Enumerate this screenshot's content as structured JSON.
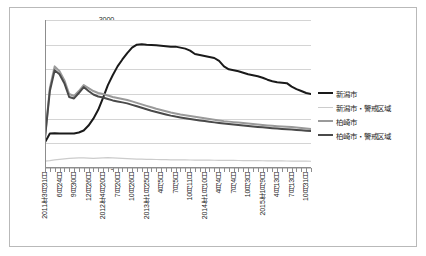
{
  "chart_data": {
    "type": "line",
    "title": "",
    "xlabel": "",
    "ylabel": "",
    "ylim": [
      0,
      3000
    ],
    "ytick_step": 500,
    "yticks": [
      "0",
      "500",
      "1000",
      "1500",
      "2000",
      "2500",
      "3000"
    ],
    "grid": true,
    "legend_position": "right",
    "x_tick_labels": [
      "2011年3月31日",
      "6月24日",
      "9月30日",
      "12月26日",
      "2012年4月20日",
      "7月20日",
      "10月26日",
      "2013年1月25日",
      "4月5日",
      "7月5日",
      "10月11日",
      "2014年1月10日",
      "4月4日",
      "7月4日",
      "10月3日",
      "2015年1月9日",
      "4月13日",
      "7月13日",
      "10月31日"
    ],
    "n_points": 56,
    "series": [
      {
        "name": "新潟市",
        "color": "#1a1a1a",
        "width": 2.0,
        "values": [
          520,
          700,
          705,
          700,
          700,
          700,
          700,
          720,
          760,
          860,
          1000,
          1180,
          1420,
          1680,
          1880,
          2060,
          2200,
          2330,
          2440,
          2500,
          2510,
          2500,
          2495,
          2490,
          2480,
          2470,
          2460,
          2460,
          2440,
          2420,
          2380,
          2310,
          2290,
          2270,
          2250,
          2230,
          2170,
          2060,
          2000,
          1980,
          1960,
          1930,
          1900,
          1880,
          1860,
          1830,
          1790,
          1760,
          1740,
          1730,
          1720,
          1650,
          1600,
          1560,
          1520,
          1500
        ]
      },
      {
        "name": "新潟市・警戒区域",
        "color": "#cccccc",
        "width": 1.2,
        "values": [
          140,
          150,
          165,
          175,
          185,
          195,
          200,
          205,
          205,
          200,
          195,
          200,
          205,
          210,
          205,
          200,
          195,
          190,
          185,
          180,
          178,
          176,
          174,
          172,
          170,
          168,
          166,
          165,
          164,
          163,
          162,
          161,
          160,
          159,
          158,
          157,
          156,
          155,
          154,
          153,
          152,
          151,
          150,
          149,
          148,
          147,
          146,
          145,
          144,
          143,
          142,
          141,
          140,
          139,
          138,
          137
        ]
      },
      {
        "name": "柏崎市",
        "color": "#9a9a9a",
        "width": 2.0,
        "values": [
          620,
          1620,
          2060,
          1960,
          1780,
          1500,
          1460,
          1560,
          1680,
          1620,
          1560,
          1520,
          1500,
          1470,
          1440,
          1420,
          1400,
          1380,
          1350,
          1320,
          1290,
          1260,
          1230,
          1200,
          1175,
          1150,
          1125,
          1105,
          1085,
          1070,
          1055,
          1040,
          1025,
          1010,
          995,
          980,
          965,
          950,
          940,
          930,
          920,
          910,
          900,
          890,
          880,
          870,
          862,
          855,
          848,
          842,
          836,
          830,
          822,
          812,
          800,
          790
        ]
      },
      {
        "name": "柏崎市・警戒区域",
        "color": "#4a4a4a",
        "width": 2.0,
        "values": [
          610,
          1560,
          1980,
          1900,
          1720,
          1440,
          1410,
          1520,
          1640,
          1560,
          1490,
          1450,
          1430,
          1400,
          1370,
          1350,
          1330,
          1310,
          1280,
          1250,
          1220,
          1190,
          1160,
          1135,
          1110,
          1085,
          1062,
          1042,
          1025,
          1010,
          995,
          980,
          965,
          952,
          938,
          925,
          912,
          900,
          890,
          880,
          870,
          860,
          850,
          840,
          832,
          824,
          816,
          808,
          800,
          793,
          786,
          780,
          772,
          764,
          756,
          748
        ]
      }
    ]
  }
}
